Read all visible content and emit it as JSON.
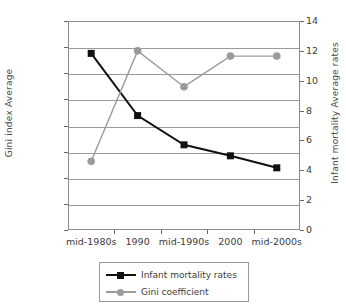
{
  "chart_data": {
    "type": "line",
    "title": "",
    "xlabel": "",
    "categories": [
      "mid-1980s",
      "1990",
      "mid-1990s",
      "2000",
      "mid-2000s"
    ],
    "grid": true,
    "legend_position": "bottom",
    "axes": {
      "left": {
        "label": "Gini index Average",
        "min": 0.27,
        "max": 0.31,
        "step": 0.005,
        "ticks": [
          "0.27",
          "0.275",
          "0.28",
          "0.285",
          "0.29",
          "0.295",
          "0.3",
          "0.305",
          "0.31"
        ],
        "tick_values": [
          0.27,
          0.275,
          0.28,
          0.285,
          0.29,
          0.295,
          0.3,
          0.305,
          0.31
        ]
      },
      "right": {
        "label": "Infant mortality Average rates",
        "min": 0,
        "max": 14,
        "step": 2,
        "ticks": [
          "0",
          "2",
          "4",
          "6",
          "8",
          "10",
          "12",
          "14"
        ],
        "tick_values": [
          0,
          2,
          4,
          6,
          8,
          10,
          12,
          14
        ]
      }
    },
    "series": [
      {
        "name": "Infant mortality rates",
        "axis": "left",
        "color": "#111111",
        "marker": "square",
        "values": [
          0.3038,
          0.2919,
          0.2863,
          0.2842,
          0.2819
        ]
      },
      {
        "name": "Gini coefficient",
        "axis": "right",
        "color": "#9b9b9b",
        "marker": "circle",
        "values": [
          4.6,
          12.0,
          9.6,
          11.65,
          11.65
        ]
      }
    ]
  },
  "legend": {
    "items": [
      {
        "label": "Infant mortality rates"
      },
      {
        "label": "Gini coefficient"
      }
    ]
  },
  "colors": {
    "series_dark": "#111111",
    "series_gray": "#9b9b9b",
    "grid": "#9a9a9a",
    "frame": "#8a8a8a",
    "text": "#3c3c3c",
    "background": "#ffffff"
  }
}
